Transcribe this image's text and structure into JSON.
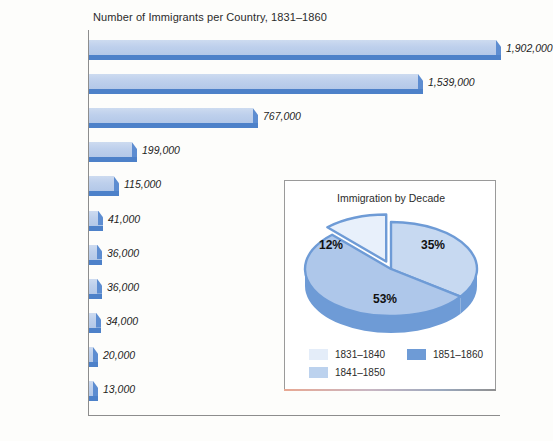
{
  "chart_data": {
    "type": "bar",
    "title": "Number of Immigrants per Country, 1831–1860",
    "xlabel": "",
    "ylabel": "",
    "orientation": "horizontal",
    "grid": false,
    "axis_max": 1902000,
    "categories": [
      "Ireland",
      "German States",
      "Great Britain",
      "France",
      "Newfoundland/ Canada",
      "China",
      "West Indies",
      "Sweden/ Norway",
      "Switzerland",
      "Netherlands",
      "Mexico"
    ],
    "values": [
      1902000,
      1539000,
      767000,
      199000,
      115000,
      41000,
      36000,
      36000,
      34000,
      20000,
      13000
    ],
    "value_labels": [
      "1,902,000",
      "1,539,000",
      "767,000",
      "199,000",
      "115,000",
      "41,000",
      "36,000",
      "36,000",
      "34,000",
      "20,000",
      "13,000"
    ],
    "bar_color_top": "#bed0ec",
    "bar_color_bevel": "#4d81c9"
  },
  "inset_chart": {
    "type": "pie",
    "title": "Immigration by Decade",
    "labels": [
      "1851–1860",
      "1841–1850",
      "1831–1840"
    ],
    "values": [
      35,
      53,
      12
    ],
    "data_labels": [
      "35%",
      "53%",
      "12%"
    ],
    "colors": [
      "#c6d8f0",
      "#a9c4e8",
      "#e4edf9"
    ],
    "legend": [
      {
        "label": "1831–1840",
        "color": "#e4edf9"
      },
      {
        "label": "1841–1850",
        "color": "#bcd2ee"
      },
      {
        "label": "1851–1860",
        "color": "#6e9bd6"
      }
    ],
    "exploded_slice": "1831–1840",
    "legend_position": "bottom"
  },
  "bar_label_lines": [
    [
      "Ireland"
    ],
    [
      "German",
      "States"
    ],
    [
      "Great Britain"
    ],
    [
      "France"
    ],
    [
      "Newfoundland/",
      "Canada"
    ],
    [
      "China"
    ],
    [
      "West Indies"
    ],
    [
      "Sweden/",
      "Norway"
    ],
    [
      "Switzerland"
    ],
    [
      "Netherlands"
    ],
    [
      "Mexico"
    ]
  ]
}
